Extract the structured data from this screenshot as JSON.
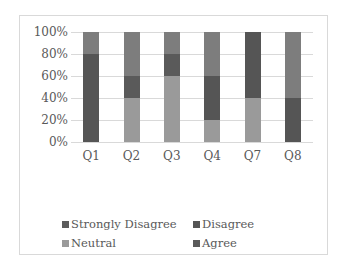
{
  "chart_data": {
    "type": "bar",
    "stacked": true,
    "percent": true,
    "title": "",
    "xlabel": "",
    "ylabel": "",
    "ylim": [
      0,
      100
    ],
    "y_ticks": [
      "0%",
      "20%",
      "40%",
      "60%",
      "80%",
      "100%"
    ],
    "categories": [
      "Q1",
      "Q2",
      "Q3",
      "Q4",
      "Q7",
      "Q8"
    ],
    "series": [
      {
        "name": "Strongly Disagree",
        "color": "#5c5c5c",
        "values": [
          0,
          0,
          0,
          0,
          0,
          0
        ]
      },
      {
        "name": "Disagree",
        "color": "#555555",
        "values": [
          80,
          20,
          20,
          40,
          60,
          40
        ]
      },
      {
        "name": "Neutral",
        "color": "#9a9a9a",
        "values": [
          0,
          40,
          60,
          20,
          40,
          0
        ]
      },
      {
        "name": "Agree",
        "color": "#7d7d7d",
        "values": [
          20,
          40,
          20,
          40,
          0,
          60
        ]
      }
    ],
    "bars": [
      {
        "label": "Q1",
        "segments": [
          {
            "series": "Disagree",
            "from": 0,
            "to": 80,
            "color": "#555555"
          },
          {
            "series": "Agree",
            "from": 80,
            "to": 100,
            "color": "#7d7d7d"
          }
        ]
      },
      {
        "label": "Q2",
        "segments": [
          {
            "series": "Neutral",
            "from": 0,
            "to": 40,
            "color": "#9a9a9a"
          },
          {
            "series": "Disagree",
            "from": 40,
            "to": 60,
            "color": "#5a5a5a"
          },
          {
            "series": "Agree",
            "from": 60,
            "to": 100,
            "color": "#7d7d7d"
          }
        ]
      },
      {
        "label": "Q3",
        "segments": [
          {
            "series": "Neutral",
            "from": 0,
            "to": 60,
            "color": "#9a9a9a"
          },
          {
            "series": "Disagree",
            "from": 60,
            "to": 80,
            "color": "#5a5a5a"
          },
          {
            "series": "Agree",
            "from": 80,
            "to": 100,
            "color": "#7d7d7d"
          }
        ]
      },
      {
        "label": "Q4",
        "segments": [
          {
            "series": "Neutral",
            "from": 0,
            "to": 20,
            "color": "#9a9a9a"
          },
          {
            "series": "Disagree",
            "from": 20,
            "to": 60,
            "color": "#555555"
          },
          {
            "series": "Agree",
            "from": 60,
            "to": 100,
            "color": "#7d7d7d"
          }
        ]
      },
      {
        "label": "Q7",
        "segments": [
          {
            "series": "Neutral",
            "from": 0,
            "to": 40,
            "color": "#9a9a9a"
          },
          {
            "series": "Disagree",
            "from": 40,
            "to": 100,
            "color": "#555555"
          }
        ]
      },
      {
        "label": "Q8",
        "segments": [
          {
            "series": "Disagree",
            "from": 0,
            "to": 40,
            "color": "#555555"
          },
          {
            "series": "Agree",
            "from": 40,
            "to": 100,
            "color": "#7d7d7d"
          }
        ]
      }
    ],
    "grid": true,
    "legend_position": "bottom",
    "legend": [
      {
        "label": "Strongly Disagree",
        "color": "#5c5c5c"
      },
      {
        "label": "Disagree",
        "color": "#555555"
      },
      {
        "label": "Neutral",
        "color": "#9a9a9a"
      },
      {
        "label": "Agree",
        "color": "#5a5a5a"
      }
    ]
  }
}
